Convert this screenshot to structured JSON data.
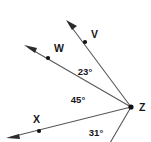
{
  "figure": {
    "type": "angle-diagram",
    "background_color": "#ffffff",
    "line_color": "#58585a",
    "text_color": "#161618"
  },
  "vertex": {
    "label": "Z",
    "x": 131,
    "y": 107,
    "label_x": 139,
    "label_y": 108
  },
  "rays": [
    {
      "id": "ray-v",
      "label": "V",
      "has_label": true,
      "tip_x": 66,
      "tip_y": 20,
      "angle_deg": 54,
      "dot_x": 85,
      "dot_y": 42,
      "label_x": 91,
      "label_y": 35
    },
    {
      "id": "ray-w",
      "label": "W",
      "has_label": true,
      "tip_x": 24,
      "tip_y": 45,
      "angle_deg": 31,
      "dot_x": 48,
      "dot_y": 58,
      "label_x": 54,
      "label_y": 49
    },
    {
      "id": "ray-x",
      "label": "X",
      "has_label": true,
      "tip_x": 6,
      "tip_y": 138,
      "angle_deg": -14,
      "dot_x": 39,
      "dot_y": 131,
      "label_x": 36,
      "label_y": 120
    },
    {
      "id": "ray-lower",
      "label": "",
      "has_label": false,
      "tip_x": 110,
      "tip_y": 143,
      "angle_deg": -61,
      "dot_x": null,
      "dot_y": null,
      "label_x": null,
      "label_y": null
    }
  ],
  "angles": [
    {
      "id": "angle-vzw",
      "value": "23°",
      "measure": 23,
      "between": "V and W",
      "x": 85,
      "y": 72
    },
    {
      "id": "angle-wzx",
      "value": "45°",
      "measure": 45,
      "between": "W and X",
      "x": 78,
      "y": 100
    },
    {
      "id": "angle-xz-lower",
      "value": "31°",
      "measure": 31,
      "between": "X and lower ray",
      "x": 96,
      "y": 133
    }
  ]
}
